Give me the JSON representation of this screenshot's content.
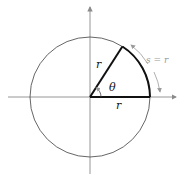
{
  "diagram": {
    "labels": {
      "radius_upper": "r",
      "radius_lower": "r",
      "angle": "θ",
      "arc": "s = r"
    },
    "geometry": {
      "center": [
        90,
        97
      ],
      "radius": 60,
      "angle_deg": 57.3
    },
    "colors": {
      "axis": "#8a8a8a",
      "circle": "#555555",
      "radius_line": "#111111",
      "arc_highlight": "#111111",
      "arc_label": "#9a9a9a",
      "arrow": "#9a9a9a"
    }
  }
}
